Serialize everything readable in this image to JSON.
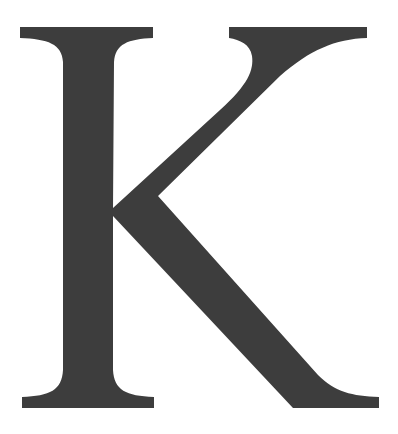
{
  "glyph": {
    "character": "K",
    "fill_color": "#3d3d3d",
    "background_color": "#ffffff"
  }
}
